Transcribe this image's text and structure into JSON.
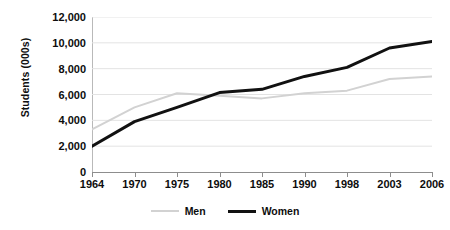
{
  "chart_data": {
    "type": "line",
    "title": "",
    "subtitle": "",
    "xlabel": "",
    "ylabel": "Students (000s)",
    "categories": [
      "1964",
      "1970",
      "1975",
      "1980",
      "1985",
      "1990",
      "1998",
      "2003",
      "2006"
    ],
    "ylim": [
      0,
      12000
    ],
    "ytick_labels": [
      "0",
      "2,000",
      "4,000",
      "6,000",
      "8,000",
      "10,000",
      "12,000"
    ],
    "ytick_values": [
      0,
      2000,
      4000,
      6000,
      8000,
      10000,
      12000
    ],
    "grid": "horizontal",
    "legend_position": "bottom",
    "series": [
      {
        "name": "Men",
        "color": "#d2d2d2",
        "width": 2,
        "values": [
          3300,
          5000,
          6100,
          5900,
          5700,
          6100,
          6300,
          7200,
          7400
        ]
      },
      {
        "name": "Women",
        "color": "#111111",
        "width": 3,
        "values": [
          2000,
          3900,
          5000,
          6150,
          6400,
          7400,
          8100,
          9600,
          10100
        ]
      }
    ]
  },
  "axes": {
    "y_title": "Students (000s)",
    "axis_color": "#8d8d8d",
    "grid_color": "#e3e3e3"
  },
  "legend": {
    "items": [
      {
        "label": "Men",
        "color": "#d2d2d2",
        "thickness": 2
      },
      {
        "label": "Women",
        "color": "#111111",
        "thickness": 3
      }
    ]
  }
}
